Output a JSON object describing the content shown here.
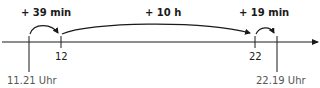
{
  "diagram": {
    "jumps": [
      {
        "label": "+ 39 min"
      },
      {
        "label": "+ 10 h"
      },
      {
        "label": "+ 19 min"
      }
    ],
    "ticks": [
      {
        "label": "12"
      },
      {
        "label": "22"
      }
    ],
    "times": {
      "start": "11.21 Uhr",
      "end": "22.19 Uhr"
    },
    "colors": {
      "line": "#1a1a1a",
      "time_text": "#555555"
    }
  }
}
